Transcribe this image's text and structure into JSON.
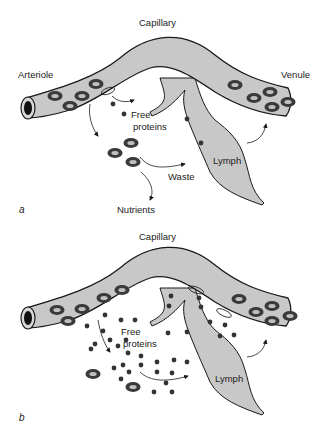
{
  "panels": [
    {
      "id": "a",
      "letter": "a",
      "labels": {
        "capillary": "Capillary",
        "arteriole": "Arteriole",
        "venule": "Venule",
        "free_proteins_line1": "Free",
        "free_proteins_line2": "proteins",
        "lymph": "Lymph",
        "waste": "Waste",
        "nutrients": "Nutrients"
      }
    },
    {
      "id": "b",
      "letter": "b",
      "labels": {
        "capillary": "Capillary",
        "free_proteins_line1": "Free",
        "free_proteins_line2": "proteins",
        "lymph": "Lymph"
      }
    }
  ],
  "colors": {
    "vessel_fill": "#c8c8c8",
    "outline": "#1a1a1a",
    "cell_dark": "#3a3a3a",
    "cell_light": "#bdbdbd",
    "protein_dot": "#333333",
    "background": "#ffffff"
  }
}
